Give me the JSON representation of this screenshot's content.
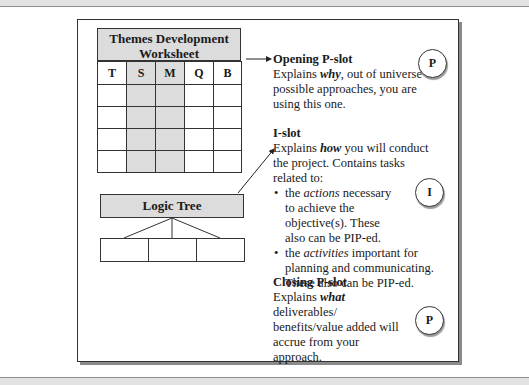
{
  "worksheet": {
    "title": "Themes Development Worksheet",
    "columns": [
      "T",
      "S",
      "M",
      "Q",
      "B"
    ],
    "shaded_columns": [
      "S",
      "M"
    ],
    "data_rows": 4
  },
  "logic_tree": {
    "label": "Logic Tree",
    "children": 3
  },
  "opening_slot": {
    "heading": "Opening P-slot",
    "pre": "Explains ",
    "emph": "why",
    "post": ", out of universe of possible approaches, you are using this one.",
    "badge": "P"
  },
  "i_slot": {
    "heading": "I-slot",
    "pre": "Explains ",
    "emph": "how",
    "post": " you will conduct the project. Contains tasks related to:",
    "bullets": [
      {
        "pre": "the ",
        "emph": "actions",
        "post": " necessary to achieve the objective(s). These also can be PIP-ed."
      },
      {
        "pre": "the ",
        "emph": "activities",
        "post": " important for planning and communicating. These also can be PIP-ed."
      }
    ],
    "badge": "I"
  },
  "closing_slot": {
    "heading": "Closing P-slot",
    "pre": "Explains ",
    "emph": "what",
    "post": " deliverables/ benefits/value added will accrue from your approach.",
    "badge": "P"
  },
  "bullet_glyph": "•",
  "colors": {
    "shade": "#dcdcdc",
    "line": "#333333",
    "band": "#e2e2e2"
  }
}
